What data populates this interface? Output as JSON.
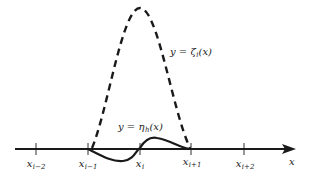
{
  "diagram": {
    "axis": {
      "label": "x",
      "color": "#1a1a1a"
    },
    "ticks": [
      {
        "base": "x",
        "sub": "i−2"
      },
      {
        "base": "x",
        "sub": "i−1"
      },
      {
        "base": "x",
        "sub": "i"
      },
      {
        "base": "x",
        "sub": "i+1"
      },
      {
        "base": "x",
        "sub": "i+2"
      }
    ],
    "curves": {
      "zeta": {
        "label": "y = ζ",
        "sub": "i",
        "arg": "(x)",
        "style": "dashed"
      },
      "eta": {
        "label": "y = η",
        "sub": "h",
        "arg": "(x)",
        "style": "solid"
      }
    }
  }
}
